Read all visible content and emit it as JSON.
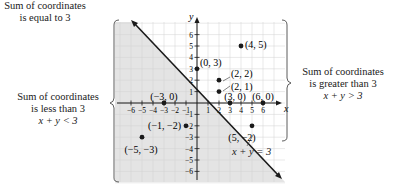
{
  "left_annotation": {
    "line1": "Sum of coordinates",
    "line2": "is less than 3",
    "inequality": "x + y < 3"
  },
  "right_annotation": {
    "line1": "Sum of coordinates",
    "line2": "is greater than 3",
    "inequality": "x + y > 3"
  },
  "bottom_annotation": {
    "equation": "x + y = 3",
    "line1": "Sum of coordinates",
    "line2": "is equal to 3"
  },
  "axes": {
    "x_label": "x",
    "y_label": "y",
    "x_ticks": [
      "−6",
      "−5",
      "−4",
      "−3",
      "−2",
      "−1",
      "1",
      "2",
      "3",
      "4",
      "5",
      "6"
    ],
    "y_ticks": [
      "6",
      "5",
      "4",
      "3",
      "2",
      "1",
      "−1",
      "−2",
      "−3",
      "−4",
      "−5",
      "−6"
    ]
  },
  "points": [
    {
      "label": "(4, 5)",
      "x": 4,
      "y": 5
    },
    {
      "label": "(0, 3)",
      "x": 0,
      "y": 3
    },
    {
      "label": "(2, 2)",
      "x": 2,
      "y": 2
    },
    {
      "label": "(2, 1)",
      "x": 2,
      "y": 1
    },
    {
      "label": "(−3, 0)",
      "x": -3,
      "y": 0
    },
    {
      "label": "(3, 0)",
      "x": 3,
      "y": 0
    },
    {
      "label": "(6, 0)",
      "x": 6,
      "y": 0
    },
    {
      "label": "(−1, −2)",
      "x": -1,
      "y": -2
    },
    {
      "label": "(5, −2)",
      "x": 5,
      "y": -2
    },
    {
      "label": "(−5, −3)",
      "x": -5,
      "y": -3
    }
  ],
  "colors": {
    "shade": "#e4e4e4",
    "grid": "#cfcfcf",
    "ink": "#1a1a1a"
  }
}
